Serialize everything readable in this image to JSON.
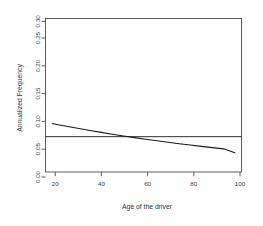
{
  "chart_data": {
    "type": "line",
    "title": "",
    "subtitle": "",
    "xlabel": "Age of the driver",
    "ylabel": "Annualized Frequency",
    "xlim": [
      15,
      103
    ],
    "ylim": [
      0.0,
      0.305
    ],
    "grid": false,
    "legend": null,
    "legend_position": "none",
    "xticks": [
      20,
      40,
      60,
      80,
      100
    ],
    "xtick_labels": [
      "20",
      "40",
      "60",
      "80",
      "100"
    ],
    "yticks": [
      0.0,
      0.05,
      0.1,
      0.15,
      0.2,
      0.25,
      0.3
    ],
    "ytick_labels": [
      "0.00",
      "0.05",
      "0.10",
      "0.15",
      "0.20",
      "0.25",
      "0.30"
    ],
    "series": [
      {
        "name": "Fitted annualized frequency by age",
        "kind": "line",
        "color": "#1a1a1a",
        "x": [
          18,
          20,
          25,
          30,
          35,
          40,
          45,
          50,
          55,
          60,
          65,
          70,
          75,
          80,
          85,
          90,
          95,
          100
        ],
        "y": [
          0.0962,
          0.0945,
          0.0903,
          0.0863,
          0.0824,
          0.0787,
          0.0751,
          0.0716,
          0.0683,
          0.0651,
          0.062,
          0.059,
          0.0562,
          0.0535,
          0.0509,
          0.0484,
          0.046,
          0.0381
        ]
      },
      {
        "name": "Overall average frequency",
        "kind": "hline",
        "color": "#1a1a1a",
        "y_value": 0.0702
      }
    ],
    "annotations": []
  },
  "axes": {
    "y_title": "Annualized Frequency",
    "x_title": "Age of the driver",
    "y_tick_labels": [
      "0.00",
      "0.05",
      "0.10",
      "0.15",
      "0.20",
      "0.25",
      "0.30"
    ],
    "x_tick_labels": [
      "20",
      "40",
      "60",
      "80",
      "100"
    ]
  },
  "colors": {
    "background": "#ffffff",
    "frame": "#4a4a4a",
    "curve": "#1a1a1a",
    "hline": "#1a1a1a",
    "text": "#333333"
  }
}
